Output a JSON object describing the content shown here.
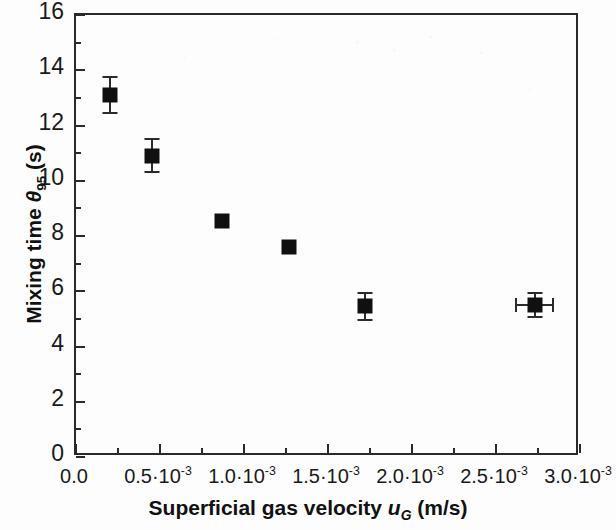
{
  "chart_data": {
    "type": "scatter",
    "title": "",
    "xlabel": "Superficial gas velocity u_G (m/s)",
    "ylabel": "Mixing time θ₉₅ (s)",
    "xlim": [
      0.0,
      0.003
    ],
    "ylim": [
      0,
      16
    ],
    "grid": false,
    "legend": null,
    "x_tick_labels": [
      "0.0",
      "0.5·10⁻³",
      "1.0·10⁻³",
      "1.5·10⁻³",
      "2.0·10⁻³",
      "2.5·10⁻³",
      "3.0·10⁻³"
    ],
    "x_tick_values": [
      0.0,
      0.0005,
      0.001,
      0.0015,
      0.002,
      0.0025,
      0.003
    ],
    "x_minor_step": 0.00025,
    "y_tick_labels": [
      "0",
      "2",
      "4",
      "6",
      "8",
      "10",
      "12",
      "14",
      "16"
    ],
    "y_tick_values": [
      0,
      2,
      4,
      6,
      8,
      10,
      12,
      14,
      16
    ],
    "y_minor_step": 1,
    "marker": "filled-square",
    "marker_color": "#101010",
    "series": [
      {
        "name": "Mixing time",
        "points": [
          {
            "x": 0.0002,
            "y": 13.1,
            "yerr": 0.65,
            "xerr": 0
          },
          {
            "x": 0.00045,
            "y": 10.9,
            "yerr": 0.6,
            "xerr": 0
          },
          {
            "x": 0.00087,
            "y": 8.55,
            "yerr": 0,
            "xerr": 0
          },
          {
            "x": 0.00127,
            "y": 7.6,
            "yerr": 0,
            "xerr": 0
          },
          {
            "x": 0.00172,
            "y": 5.45,
            "yerr": 0.5,
            "xerr": 0
          },
          {
            "x": 0.00273,
            "y": 5.5,
            "yerr": 0.45,
            "xerr": 0.00011
          }
        ]
      }
    ]
  },
  "axis_titles": {
    "x_prefix": "Superficial gas velocity ",
    "x_symbol": "u",
    "x_subscript": "G",
    "x_suffix": " (m/s)",
    "y_prefix": "Mixing time ",
    "y_symbol": "θ",
    "y_subscript": "95",
    "y_suffix": " (s)"
  },
  "colors": {
    "axis": "#2a2a2a",
    "marker": "#101010",
    "background": "#fdfdfd",
    "text": "#1a1a1a"
  }
}
